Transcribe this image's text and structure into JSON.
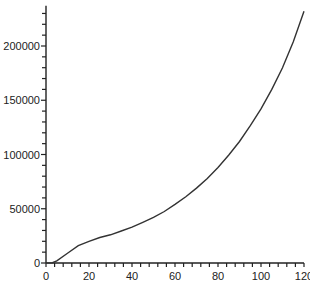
{
  "chart_data": {
    "type": "line",
    "title": "",
    "xlabel": "",
    "ylabel": "",
    "xlim": [
      0,
      120
    ],
    "ylim": [
      0,
      237000
    ],
    "grid": false,
    "legend": null,
    "x_ticks": [
      0,
      20,
      40,
      60,
      80,
      100,
      120
    ],
    "x_tick_labels": [
      "0",
      "20",
      "40",
      "60",
      "80",
      "100",
      "120"
    ],
    "y_ticks": [
      0,
      50000,
      100000,
      150000,
      200000
    ],
    "y_tick_labels": [
      "0",
      "50000",
      "100000",
      "150000",
      "200000"
    ],
    "series": [
      {
        "name": "curve",
        "color": "#333333",
        "x": [
          0,
          3,
          5,
          10,
          15,
          20,
          25,
          30,
          35,
          40,
          45,
          50,
          55,
          60,
          65,
          70,
          75,
          80,
          85,
          90,
          95,
          100,
          105,
          110,
          115,
          120
        ],
        "y": [
          0,
          300,
          2000,
          9000,
          16000,
          20000,
          23500,
          26000,
          29500,
          33000,
          37500,
          42000,
          47500,
          54000,
          61000,
          69000,
          78000,
          88000,
          99500,
          112000,
          126500,
          142000,
          160000,
          180000,
          204000,
          232000
        ]
      }
    ]
  }
}
